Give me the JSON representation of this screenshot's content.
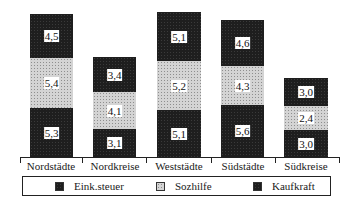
{
  "chart_data": {
    "type": "bar",
    "stacked": true,
    "title": "",
    "xlabel": "",
    "ylabel": "",
    "categories": [
      "Nordstädte",
      "Nordkreise",
      "Weststädte",
      "Südstädte",
      "Südkreise"
    ],
    "series": [
      {
        "name": "Eink.steuer",
        "pattern": "dark",
        "values": [
          "5,3",
          "3,1",
          "5,1",
          "5,6",
          "3,0"
        ]
      },
      {
        "name": "Sozhilfe",
        "pattern": "light",
        "values": [
          "5,4",
          "4,1",
          "5,2",
          "4,3",
          "2,4"
        ]
      },
      {
        "name": "Kaufkraft",
        "pattern": "dark",
        "values": [
          "4,5",
          "3,4",
          "5,1",
          "4,6",
          "3,0"
        ]
      }
    ],
    "numeric_series": [
      {
        "name": "Eink.steuer",
        "values": [
          5.3,
          3.1,
          5.1,
          5.6,
          3.0
        ]
      },
      {
        "name": "Sozhilfe",
        "values": [
          5.4,
          4.1,
          5.2,
          4.3,
          2.4
        ]
      },
      {
        "name": "Kaufkraft",
        "values": [
          4.5,
          3.4,
          5.1,
          4.6,
          3.0
        ]
      }
    ],
    "value_labels": true,
    "y_axis_visible": false,
    "grid": false,
    "legend_position": "bottom"
  },
  "bars": [
    {
      "x": 30,
      "w": 43,
      "segments": [
        {
          "top": 108,
          "h": 49,
          "cls": "dark",
          "label": "5,3"
        },
        {
          "top": 58,
          "h": 50,
          "cls": "light",
          "label": "5,4"
        },
        {
          "top": 14,
          "h": 44,
          "cls": "dark",
          "label": "4,5"
        }
      ]
    },
    {
      "x": 93,
      "w": 43,
      "segments": [
        {
          "top": 129,
          "h": 28,
          "cls": "dark",
          "label": "3,1"
        },
        {
          "top": 92,
          "h": 37,
          "cls": "light",
          "label": "4,1"
        },
        {
          "top": 57,
          "h": 35,
          "cls": "dark",
          "label": "3,4"
        }
      ]
    },
    {
      "x": 157,
      "w": 44,
      "segments": [
        {
          "top": 110,
          "h": 47,
          "cls": "dark",
          "label": "5,1"
        },
        {
          "top": 61,
          "h": 49,
          "cls": "light",
          "label": "5,2"
        },
        {
          "top": 12,
          "h": 49,
          "cls": "dark",
          "label": "5,1"
        }
      ]
    },
    {
      "x": 221,
      "w": 43,
      "segments": [
        {
          "top": 105,
          "h": 52,
          "cls": "dark",
          "label": "5,6"
        },
        {
          "top": 66,
          "h": 39,
          "cls": "light",
          "label": "4,3"
        },
        {
          "top": 20,
          "h": 46,
          "cls": "dark",
          "label": "4,6"
        }
      ]
    },
    {
      "x": 284,
      "w": 44,
      "segments": [
        {
          "top": 130,
          "h": 27,
          "cls": "dark",
          "label": "3,0"
        },
        {
          "top": 106,
          "h": 24,
          "cls": "light",
          "label": "2,4"
        },
        {
          "top": 78,
          "h": 28,
          "cls": "dark",
          "label": "3,0"
        }
      ]
    }
  ],
  "ticks": [
    20,
    82,
    146,
    211,
    275,
    339
  ],
  "category_labels": [
    {
      "text": "Nordstädte",
      "cx": 51
    },
    {
      "text": "Nordkreise",
      "cx": 115
    },
    {
      "text": "Weststädte",
      "cx": 179
    },
    {
      "text": "Südstädte",
      "cx": 243
    },
    {
      "text": "Südkreise",
      "cx": 306
    }
  ],
  "legend": {
    "items": [
      {
        "label": "Eink.steuer",
        "cls": "dark",
        "x": 22
      },
      {
        "label": "Sozhilfe",
        "cls": "light",
        "x": 123
      },
      {
        "label": "Kaufkraft",
        "cls": "dark",
        "x": 220
      }
    ]
  },
  "colors": {
    "dark": "#1e1e1e",
    "light": "#d4d4d4",
    "axis": "#222222",
    "background": "#ffffff"
  }
}
